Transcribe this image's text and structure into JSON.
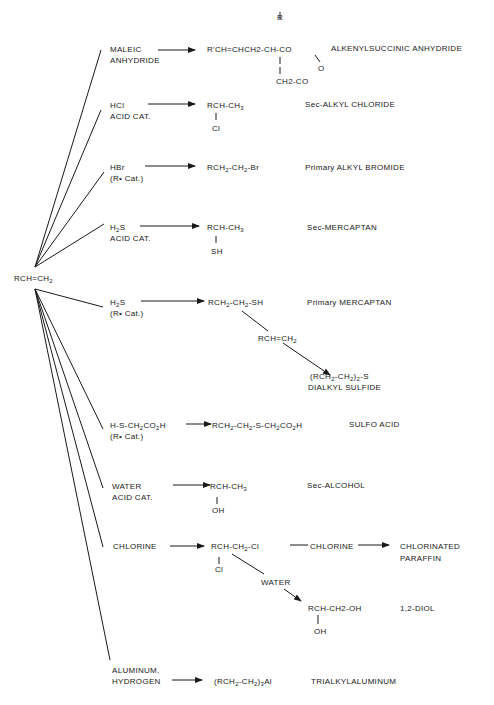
{
  "center": {
    "label": "RCH=CH",
    "sub": "2"
  },
  "reactions": [
    {
      "reagent": [
        "MALEIC",
        "ANHYDRIDE"
      ],
      "product_main": "R'CH=CHCH2-CH-CO",
      "product_top": "R",
      "product_o": "O",
      "product_bottom": "CH2-CO",
      "name": "ALKENYLSUCCINIC ANHYDRIDE"
    },
    {
      "reagent": [
        "HCl",
        "ACID CAT."
      ],
      "product_main": "RCH-CH",
      "product_main_sub": "3",
      "product_bottom": "Cl",
      "name": "Sec-ALKYL CHLORIDE"
    },
    {
      "reagent": [
        "HBr",
        "(R• Cat.)"
      ],
      "product_parts": [
        "RCH",
        "2",
        "-CH",
        "2",
        "-Br"
      ],
      "name": "Primary ALKYL BROMIDE"
    },
    {
      "reagent_parts": [
        "H",
        "2",
        "S"
      ],
      "reagent_line2": "ACID CAT.",
      "product_main": "RCH-CH",
      "product_main_sub": "3",
      "product_bottom": "SH",
      "name": "Sec-MERCAPTAN"
    },
    {
      "reagent_parts": [
        "H",
        "2",
        "S"
      ],
      "reagent_line2": "(R• Cat.)",
      "product_parts": [
        "RCH",
        "2",
        "-CH",
        "2",
        "-SH"
      ],
      "name": "Primary MERCAPTAN",
      "branch": {
        "reagent_parts": [
          "RCH=CH",
          "2"
        ],
        "product_parts": [
          "(RCH",
          "2",
          "-CH",
          "2",
          ")",
          "2",
          "-S"
        ],
        "name": "DIALKYL SULFIDE"
      }
    },
    {
      "reagent_parts": [
        "H-S-CH",
        "2",
        "CO",
        "2",
        "H"
      ],
      "reagent_line2": "(R• Cat.)",
      "product_parts": [
        "RCH",
        "2",
        "-CH",
        "2",
        "-S-CH",
        "2",
        "CO",
        "2",
        "H"
      ],
      "name": "SULFO ACID"
    },
    {
      "reagent": [
        "WATER",
        "ACID CAT."
      ],
      "product_main": "RCH-CH",
      "product_main_sub": "3",
      "product_bottom": "OH",
      "name": "Sec-ALCOHOL"
    },
    {
      "reagent": [
        "CHLORINE"
      ],
      "product_parts": [
        "RCH-CH",
        "2",
        "-Cl"
      ],
      "product_bottom": "Cl",
      "name": "",
      "branch_chlorine": {
        "reagent": "CHLORINE",
        "name": [
          "CHLORINATED",
          "PARAFFIN"
        ]
      },
      "branch_water": {
        "reagent": "WATER",
        "product_main": "RCH-CH2-OH",
        "product_bottom": "OH",
        "name": "1,2-DIOL"
      }
    },
    {
      "reagent": [
        "ALUMINUM,",
        "HYDROGEN"
      ],
      "product_parts": [
        "(RCH",
        "2",
        "-CH",
        "2",
        ")",
        "3",
        "Al"
      ],
      "name": "TRIALKYLALUMINUM"
    }
  ]
}
